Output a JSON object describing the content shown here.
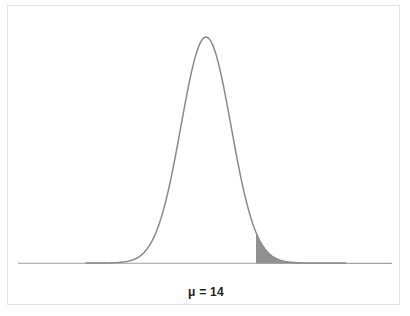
{
  "figure": {
    "background_color": "#ffffff",
    "frame_color": "#e3e3e3",
    "mu_label": "μ = 14",
    "caption_partial": "",
    "curve_color": "#8a8a8a",
    "shade_color": "#909090",
    "axis_color": "#9e9e9e"
  },
  "chart_data": {
    "type": "line",
    "title": "",
    "subtitle": "",
    "xlabel": "μ = 14",
    "ylabel": "",
    "grid": false,
    "legend": null,
    "annotations": [
      {
        "text": "μ = 14",
        "role": "mean-label",
        "x": 14,
        "placement": "below-axis-centered-on-peak"
      }
    ],
    "distribution": {
      "kind": "normal",
      "mean": 14,
      "sigma_px": 25,
      "peak_px": {
        "x": 206,
        "y": 37
      },
      "baseline_y_px": 263,
      "axis_start_px": 18,
      "axis_end_px": 392
    },
    "shaded_region": {
      "label": "right-tail",
      "fill": "#909090",
      "from_px": 256,
      "to_px": 392,
      "from_sigma": 2.0,
      "side": "upper"
    },
    "x": [
      18,
      60,
      100,
      120,
      140,
      156,
      170,
      181,
      190,
      198,
      206,
      214,
      222,
      231,
      241,
      256,
      270,
      290,
      310,
      340,
      392
    ],
    "y": [
      263,
      263,
      262,
      259,
      249,
      231,
      203,
      172,
      140,
      100,
      37,
      100,
      140,
      172,
      203,
      231,
      249,
      259,
      262,
      263,
      263
    ],
    "xlim": [
      18,
      392
    ],
    "ylim": [
      263,
      37
    ]
  }
}
